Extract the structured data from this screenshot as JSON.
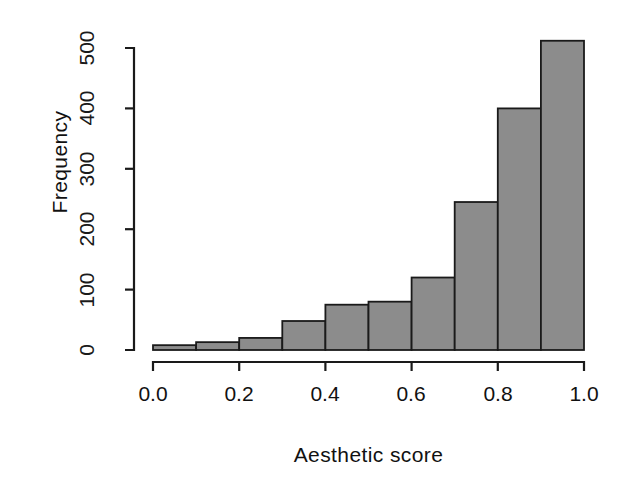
{
  "chart_data": {
    "type": "bar",
    "title": "",
    "subtitle": "",
    "xlabel": "Aesthetic score",
    "ylabel": "Frequency",
    "categories": [
      "0.0-0.1",
      "0.1-0.2",
      "0.2-0.3",
      "0.3-0.4",
      "0.4-0.5",
      "0.5-0.6",
      "0.6-0.7",
      "0.7-0.8",
      "0.8-0.9",
      "0.9-1.0"
    ],
    "bin_edges": [
      0.0,
      0.1,
      0.2,
      0.3,
      0.4,
      0.5,
      0.6,
      0.7,
      0.8,
      0.9,
      1.0
    ],
    "values": [
      8,
      13,
      20,
      48,
      75,
      80,
      120,
      245,
      400,
      512
    ],
    "xlim": [
      0.0,
      1.0
    ],
    "ylim": [
      0,
      512
    ],
    "xticks": [
      0.0,
      0.2,
      0.4,
      0.6,
      0.8,
      1.0
    ],
    "xtick_labels": [
      "0.0",
      "0.2",
      "0.4",
      "0.6",
      "0.8",
      "1.0"
    ],
    "yticks": [
      0,
      100,
      200,
      300,
      400,
      500
    ],
    "ytick_labels": [
      "0",
      "100",
      "200",
      "300",
      "400",
      "500"
    ],
    "grid": false,
    "legend": null,
    "bar_fill_color": "#8c8c8c",
    "bar_border_color": "#1a1a1a",
    "axis_color": "#1a1a1a",
    "background_color": "#ffffff"
  }
}
